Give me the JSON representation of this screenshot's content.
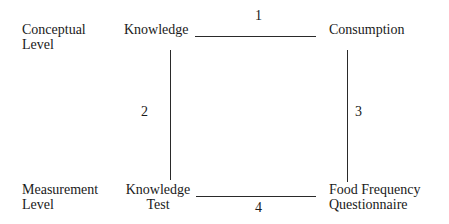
{
  "diagram": {
    "levels": {
      "conceptual": [
        "Conceptual",
        "Level"
      ],
      "measurement": [
        "Measurement",
        "Level"
      ]
    },
    "nodes": {
      "knowledge": "Knowledge",
      "consumption": "Consumption",
      "knowledge_test": [
        "Knowledge",
        "Test"
      ],
      "ffq": [
        "Food Frequency",
        "Questionnaire"
      ]
    },
    "edges": [
      {
        "label": "1",
        "from": "Knowledge",
        "to": "Consumption"
      },
      {
        "label": "2",
        "from": "Knowledge",
        "to": "Knowledge Test"
      },
      {
        "label": "3",
        "from": "Consumption",
        "to": "Food Frequency Questionnaire"
      },
      {
        "label": "4",
        "from": "Knowledge Test",
        "to": "Food Frequency Questionnaire"
      }
    ]
  }
}
